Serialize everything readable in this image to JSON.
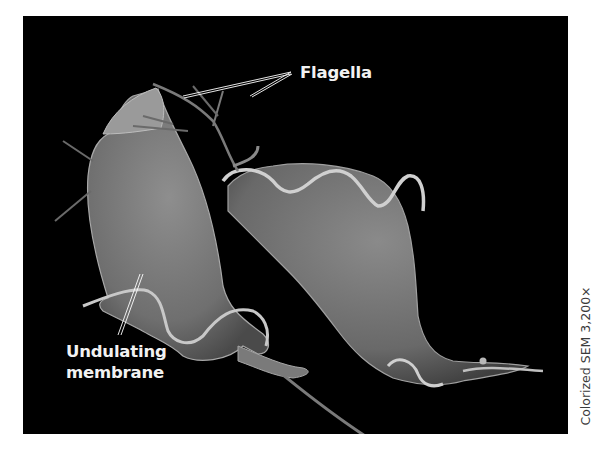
{
  "figure": {
    "type": "scanning electron micrograph",
    "background_color": "#000000",
    "cell_color": "#8a8a8a",
    "labels": {
      "flagella": "Flagella",
      "undulating_membrane_line1": "Undulating",
      "undulating_membrane_line2": "membrane"
    },
    "side_caption": "Colorized SEM  3,200×",
    "bottom_caption_visible": ""
  }
}
